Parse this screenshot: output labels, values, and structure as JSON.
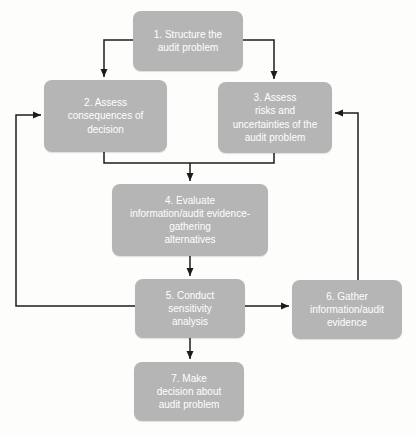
{
  "diagram": {
    "type": "flowchart",
    "colors": {
      "box_fill": "#b5b5b5",
      "box_text": "#ffffff",
      "line": "#1c1c1c",
      "background": "#fdfdfb"
    },
    "boxes": [
      {
        "id": "1",
        "label": "1. Structure the\naudit problem"
      },
      {
        "id": "2",
        "label": "2. Assess\nconsequences of\ndecision"
      },
      {
        "id": "3",
        "label": "3. Assess\nrisks and\nuncertainties of the\naudit problem"
      },
      {
        "id": "4",
        "label": "4. Evaluate\ninformation/audit evidence-\ngathering\nalternatives"
      },
      {
        "id": "5",
        "label": "5. Conduct\nsensitivity\nanalysis"
      },
      {
        "id": "6",
        "label": "6. Gather\ninformation/audit\nevidence"
      },
      {
        "id": "7",
        "label": "7. Make\ndecision about\naudit problem"
      }
    ],
    "edges": [
      {
        "from": "1",
        "to": "2"
      },
      {
        "from": "1",
        "to": "3"
      },
      {
        "from": "2",
        "to": "4"
      },
      {
        "from": "3",
        "to": "4"
      },
      {
        "from": "4",
        "to": "5"
      },
      {
        "from": "5",
        "to": "6"
      },
      {
        "from": "6",
        "to": "3"
      },
      {
        "from": "5",
        "to": "2"
      },
      {
        "from": "5",
        "to": "7"
      }
    ]
  }
}
